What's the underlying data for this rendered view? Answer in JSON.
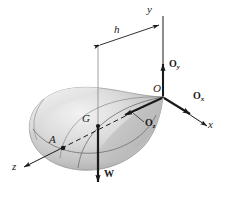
{
  "figure": {
    "background": "#ffffff",
    "ink": "#1a1a1a",
    "body_fill_light": "#e8e8e8",
    "body_fill_mid": "#c9c9c9",
    "body_fill_dark": "#a8a8a8"
  },
  "axes": [
    {
      "name": "y",
      "label": "y",
      "direction": "up-vertical",
      "style": "solid"
    },
    {
      "name": "x",
      "label": "x",
      "direction": "lower-right",
      "style": "solid"
    },
    {
      "name": "z",
      "label": "z",
      "direction": "lower-left",
      "style": "solid-with-dashed-interior"
    }
  ],
  "points": [
    {
      "name": "O",
      "label": "O",
      "role": "origin-pivot"
    },
    {
      "name": "G",
      "label": "G",
      "role": "center-of-gravity"
    },
    {
      "name": "A",
      "label": "A",
      "role": "surface-point-on-z-axis"
    }
  ],
  "vectors": [
    {
      "name": "Ox",
      "label": "O",
      "subscript": "x",
      "direction": "lower-right",
      "role": "reaction-force"
    },
    {
      "name": "Oy",
      "label": "O",
      "subscript": "y",
      "direction": "up",
      "role": "reaction-force"
    },
    {
      "name": "Oz",
      "label": "O",
      "subscript": "z",
      "direction": "lower-left",
      "role": "reaction-force"
    },
    {
      "name": "W",
      "label": "W",
      "direction": "down",
      "role": "weight-force"
    }
  ],
  "dimensions": [
    {
      "name": "h",
      "label": "h",
      "type": "double-headed-arrow",
      "role": "horizontal-distance-from-y-axis-to-G"
    }
  ]
}
